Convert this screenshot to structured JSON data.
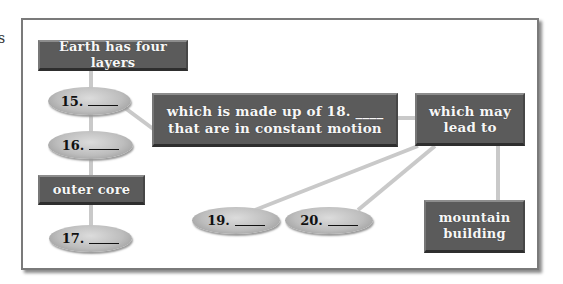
{
  "page": {
    "edge_fragment": "s"
  },
  "diagram": {
    "type": "concept-map",
    "nodes": {
      "root": {
        "text": "Earth has four layers"
      },
      "q15": {
        "number": "15."
      },
      "q16": {
        "number": "16."
      },
      "outer_core": {
        "text": "outer core"
      },
      "q17": {
        "number": "17."
      },
      "made_up": {
        "line1": "which is made up of 18. ____",
        "line2": "that are in constant motion"
      },
      "may_lead": {
        "line1": "which may",
        "line2": "lead to"
      },
      "q19": {
        "number": "19."
      },
      "q20": {
        "number": "20."
      },
      "mountain": {
        "line1": "mountain",
        "line2": "building"
      }
    },
    "edges": [
      [
        "root",
        "q15"
      ],
      [
        "q15",
        "q16"
      ],
      [
        "q16",
        "outer_core"
      ],
      [
        "outer_core",
        "q17"
      ],
      [
        "q15",
        "made_up"
      ],
      [
        "made_up",
        "may_lead"
      ],
      [
        "may_lead",
        "q19"
      ],
      [
        "may_lead",
        "q20"
      ],
      [
        "may_lead",
        "mountain"
      ]
    ],
    "colors": {
      "box_fill": "#5b5b5b",
      "box_text": "#f7f7f7",
      "oval_fill": "#c4c4c4",
      "connector": "#c8c8c8",
      "frame": "#7a7a7a"
    }
  }
}
